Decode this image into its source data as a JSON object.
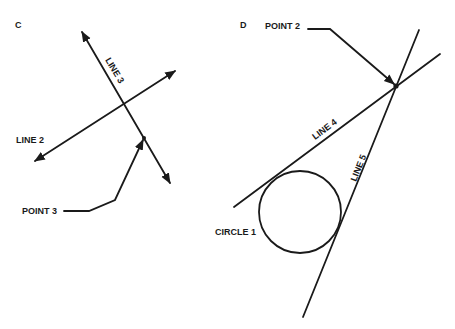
{
  "panels": {
    "c": {
      "label": "C",
      "line2": {
        "label": "LINE 2"
      },
      "line3": {
        "label": "LINE 3"
      },
      "point3": {
        "label": "POINT 3"
      }
    },
    "d": {
      "label": "D",
      "point2": {
        "label": "POINT 2"
      },
      "line4": {
        "label": "LINE 4"
      },
      "line5": {
        "label": "LINE 5"
      },
      "circle1": {
        "label": "CIRCLE 1"
      }
    }
  },
  "colors": {
    "ink": "#1a1a1a",
    "background": "#ffffff"
  }
}
